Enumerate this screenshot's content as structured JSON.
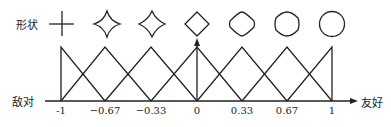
{
  "labels": {
    "shape_row": "形状",
    "axis_left": "敌对",
    "axis_right": "友好"
  },
  "axis": {
    "ticks": [
      "-1",
      "−0.67",
      "−0.33",
      "0",
      "0.33",
      "0.67",
      "1"
    ],
    "values": [
      -1,
      -0.67,
      -0.33,
      0,
      0.33,
      0.67,
      1
    ]
  },
  "shapes": [
    {
      "name": "cross",
      "roundness": 0
    },
    {
      "name": "four-point-star",
      "roundness": 0.2
    },
    {
      "name": "concave-diamond",
      "roundness": 0.4
    },
    {
      "name": "diamond",
      "roundness": 0.6
    },
    {
      "name": "rounded-diamond",
      "roundness": 0.75
    },
    {
      "name": "rounder-diamond",
      "roundness": 0.9
    },
    {
      "name": "circle",
      "roundness": 1
    }
  ],
  "membership_functions": {
    "type": "triangular",
    "count": 7,
    "peaks": [
      -1,
      -0.67,
      -0.33,
      0,
      0.33,
      0.67,
      1
    ]
  },
  "colors": {
    "line": "#222222",
    "background": "#ffffff"
  }
}
